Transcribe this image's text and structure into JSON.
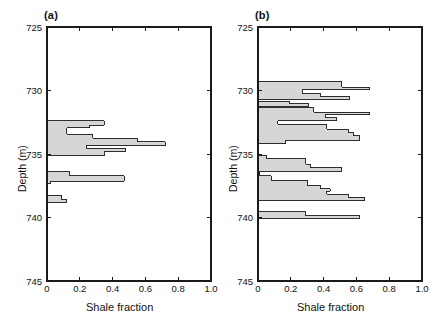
{
  "figure": {
    "panels": [
      {
        "id": "a",
        "label": "(a)",
        "xlabel": "Shale fraction",
        "ylabel": "Depth (m)"
      },
      {
        "id": "b",
        "label": "(b)",
        "xlabel": "Shale fraction",
        "ylabel": "Depth (m)"
      }
    ],
    "colors": {
      "fill": "#d6d6d6",
      "stroke": "#1a1a1a",
      "axis": "#1a1a1a",
      "text": "#111111",
      "background": "#ffffff"
    }
  },
  "chart_data": [
    {
      "type": "area",
      "title": "(a)",
      "xlabel": "Shale fraction",
      "ylabel": "Depth (m)",
      "xlim": [
        0,
        1.0
      ],
      "ylim": [
        745,
        725
      ],
      "y_inverted": true,
      "xticks": [
        0,
        0.2,
        0.4,
        0.6,
        0.8,
        1.0
      ],
      "xtick_labels": [
        "0",
        "0.2",
        "0.4",
        "0.6",
        "0.8",
        "1.0"
      ],
      "yticks": [
        725,
        730,
        735,
        740,
        745
      ],
      "ytick_labels": [
        "725",
        "730",
        "735",
        "740",
        "745"
      ],
      "grid": false,
      "legend": null,
      "orientation": "horizontal-steps",
      "series": [
        {
          "name": "Shale fraction vs depth",
          "steps": [
            {
              "depth_top": 732.4,
              "depth_bottom": 732.75,
              "value": 0.35
            },
            {
              "depth_top": 732.75,
              "depth_bottom": 732.95,
              "value": 0.26
            },
            {
              "depth_top": 732.95,
              "depth_bottom": 733.45,
              "value": 0.12
            },
            {
              "depth_top": 733.45,
              "depth_bottom": 733.75,
              "value": 0.28
            },
            {
              "depth_top": 733.75,
              "depth_bottom": 734.05,
              "value": 0.55
            },
            {
              "depth_top": 734.05,
              "depth_bottom": 734.35,
              "value": 0.72
            },
            {
              "depth_top": 734.35,
              "depth_bottom": 734.55,
              "value": 0.24
            },
            {
              "depth_top": 734.55,
              "depth_bottom": 734.8,
              "value": 0.48
            },
            {
              "depth_top": 734.8,
              "depth_bottom": 735.15,
              "value": 0.35
            },
            {
              "depth_top": 736.4,
              "depth_bottom": 736.7,
              "value": 0.14
            },
            {
              "depth_top": 736.7,
              "depth_bottom": 737.15,
              "value": 0.47
            },
            {
              "depth_top": 737.15,
              "depth_bottom": 737.35,
              "value": 0.02
            },
            {
              "depth_top": 738.25,
              "depth_bottom": 738.6,
              "value": 0.09
            },
            {
              "depth_top": 738.6,
              "depth_bottom": 738.8,
              "value": 0.12
            }
          ]
        }
      ]
    },
    {
      "type": "area",
      "title": "(b)",
      "xlabel": "Shale fraction",
      "ylabel": "Depth (m)",
      "xlim": [
        0,
        1.0
      ],
      "ylim": [
        745,
        725
      ],
      "y_inverted": true,
      "xticks": [
        0,
        0.2,
        0.4,
        0.6,
        0.8,
        1.0
      ],
      "xtick_labels": [
        "0",
        "0.2",
        "0.4",
        "0.6",
        "0.8",
        "1.0"
      ],
      "yticks": [
        725,
        730,
        735,
        740,
        745
      ],
      "ytick_labels": [
        "725",
        "730",
        "735",
        "740",
        "745"
      ],
      "grid": false,
      "legend": null,
      "orientation": "horizontal-steps",
      "series": [
        {
          "name": "Shale fraction vs depth",
          "steps": [
            {
              "depth_top": 729.3,
              "depth_bottom": 729.75,
              "value": 0.51
            },
            {
              "depth_top": 729.75,
              "depth_bottom": 729.95,
              "value": 0.68
            },
            {
              "depth_top": 729.95,
              "depth_bottom": 730.2,
              "value": 0.27
            },
            {
              "depth_top": 730.2,
              "depth_bottom": 730.45,
              "value": 0.38
            },
            {
              "depth_top": 730.45,
              "depth_bottom": 730.7,
              "value": 0.56
            },
            {
              "depth_top": 730.85,
              "depth_bottom": 731.05,
              "value": 0.19
            },
            {
              "depth_top": 731.05,
              "depth_bottom": 731.25,
              "value": 0.31
            },
            {
              "depth_top": 731.35,
              "depth_bottom": 731.7,
              "value": 0.34
            },
            {
              "depth_top": 731.7,
              "depth_bottom": 731.9,
              "value": 0.68
            },
            {
              "depth_top": 731.9,
              "depth_bottom": 732.15,
              "value": 0.41
            },
            {
              "depth_top": 732.15,
              "depth_bottom": 732.4,
              "value": 0.48
            },
            {
              "depth_top": 732.4,
              "depth_bottom": 732.65,
              "value": 0.12
            },
            {
              "depth_top": 732.65,
              "depth_bottom": 733.05,
              "value": 0.42
            },
            {
              "depth_top": 733.05,
              "depth_bottom": 733.3,
              "value": 0.55
            },
            {
              "depth_top": 733.3,
              "depth_bottom": 733.55,
              "value": 0.58
            },
            {
              "depth_top": 733.55,
              "depth_bottom": 733.9,
              "value": 0.62
            },
            {
              "depth_top": 733.9,
              "depth_bottom": 734.2,
              "value": 0.17
            },
            {
              "depth_top": 735.1,
              "depth_bottom": 735.35,
              "value": 0.05
            },
            {
              "depth_top": 735.35,
              "depth_bottom": 735.8,
              "value": 0.29
            },
            {
              "depth_top": 735.8,
              "depth_bottom": 736.05,
              "value": 0.32
            },
            {
              "depth_top": 736.05,
              "depth_bottom": 736.35,
              "value": 0.51
            },
            {
              "depth_top": 736.45,
              "depth_bottom": 736.6,
              "value": 0.01
            },
            {
              "depth_top": 736.7,
              "depth_bottom": 737.05,
              "value": 0.08
            },
            {
              "depth_top": 737.05,
              "depth_bottom": 737.45,
              "value": 0.3
            },
            {
              "depth_top": 737.45,
              "depth_bottom": 737.75,
              "value": 0.38
            },
            {
              "depth_top": 737.75,
              "depth_bottom": 737.95,
              "value": 0.44
            },
            {
              "depth_top": 737.95,
              "depth_bottom": 738.15,
              "value": 0.42
            },
            {
              "depth_top": 738.15,
              "depth_bottom": 738.4,
              "value": 0.55
            },
            {
              "depth_top": 738.4,
              "depth_bottom": 738.7,
              "value": 0.65
            },
            {
              "depth_top": 739.55,
              "depth_bottom": 739.85,
              "value": 0.29
            },
            {
              "depth_top": 739.85,
              "depth_bottom": 740.05,
              "value": 0.62
            }
          ]
        }
      ]
    }
  ]
}
